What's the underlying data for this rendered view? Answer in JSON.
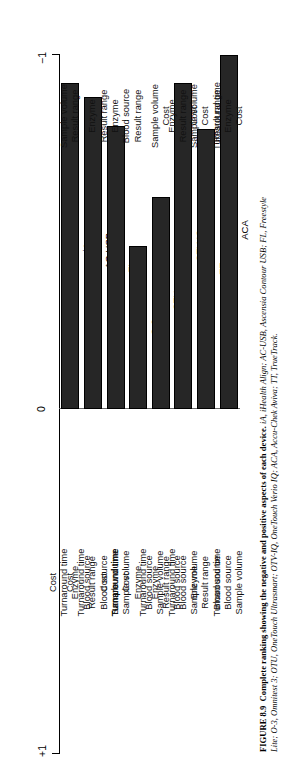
{
  "figure": {
    "number": "FIGURE 8.9",
    "caption_bold": "Complete ranking showing the negative and positive aspects of each device.",
    "caption_line1_rest": " iA, iHealth Align; AC-USB, Ascensia Contour USB; FL, Freestyle",
    "caption_line2": "Lite; O-3, Omnitest 3; OTU, OneTouch Ultrasmart; OTV-IQ, OneTouch Verio IQ; ACA, Accu-Chek Aviva; TT, TrueTrack."
  },
  "axis": {
    "left_label": "+1",
    "zero_label": "0",
    "right_label": "−1",
    "min": -1,
    "max": 1
  },
  "chart_data": {
    "type": "bar",
    "title": "Complete ranking showing the negative and positive aspects of each device.",
    "orientation": "horizontal",
    "xlabel": "",
    "ylabel": "",
    "xlim": [
      1,
      -1
    ],
    "grid": false,
    "legend": "none",
    "categories": [
      "iA",
      "AC-USB",
      "FL",
      "O-3",
      "OTU",
      "OTV-IQ",
      "TT",
      "ACA"
    ],
    "values": [
      -0.92,
      -0.88,
      -0.8,
      -0.46,
      -0.6,
      -0.92,
      -0.79,
      -1.0
    ],
    "bars": [
      {
        "label": "iA",
        "value": -0.92,
        "positive_aspects": [
          "Cost",
          "Turnaround time",
          "Enzyme",
          "Blood source"
        ],
        "negative_aspects": [
          "Sample volume",
          "Result range"
        ]
      },
      {
        "label": "AC-USB",
        "value": -0.88,
        "positive_aspects": [
          "Cost",
          "Turnaround time",
          "Result range",
          "Blood source",
          "Sample volume"
        ],
        "negative_aspects": [
          "Enzyme"
        ]
      },
      {
        "label": "FL",
        "value": -0.8,
        "positive_aspects": [
          "Cost",
          "Turnaround time",
          "Sample volume"
        ],
        "negative_aspects": [
          "Result range",
          "Enzyme",
          "Blood source"
        ]
      },
      {
        "label": "O-3",
        "value": -0.46,
        "positive_aspects": [
          "Turnaround time",
          "Cost",
          "Enzyme",
          "Blood source",
          "Sample volume"
        ],
        "negative_aspects": [
          "Result range"
        ]
      },
      {
        "label": "OTU",
        "value": -0.6,
        "positive_aspects": [
          "Turnaround time",
          "Enzyme",
          "Result range",
          "Blood source"
        ],
        "negative_aspects": [
          "Sample volume",
          "Cost"
        ]
      },
      {
        "label": "OTV-IQ",
        "value": -0.92,
        "positive_aspects": [
          "Turnaround time",
          "Blood source",
          "Sample volume"
        ],
        "negative_aspects": [
          "Enzyme",
          "Result range",
          "Cost"
        ]
      },
      {
        "label": "TT",
        "value": -0.79,
        "positive_aspects": [
          "Enzyme",
          "Result range",
          "Blood source"
        ],
        "negative_aspects": [
          "Sample volume",
          "Cost",
          "Turnaround time"
        ]
      },
      {
        "label": "ACA",
        "value": -1.0,
        "positive_aspects": [
          "Turnaround time",
          "Blood source",
          "Sample volume"
        ],
        "negative_aspects": [
          "Result range",
          "Enzyme",
          "Cost"
        ]
      }
    ]
  }
}
